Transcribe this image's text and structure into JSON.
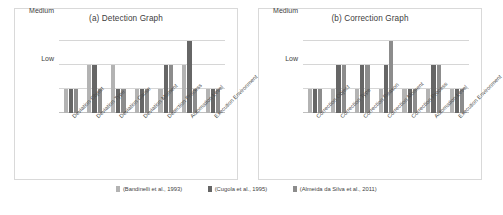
{
  "legend": {
    "position": "bottom-center",
    "entries": [
      {
        "label": "(Bandinelli et al., 1993)",
        "color": "#b3b3b3"
      },
      {
        "label": "(Cugola et al., 1995)",
        "color": "#666666"
      },
      {
        "label": "(Almeida da Silva et al., 2011)",
        "color": "#8c8c8c"
      }
    ]
  },
  "chart_data": [
    {
      "type": "bar",
      "id": "detection-graph",
      "title": "(a) Detection Graph",
      "xlabel": "",
      "ylabel": "",
      "grid": true,
      "ytick_labels": [
        "Low",
        "Medium",
        "High"
      ],
      "ytick_values": [
        1,
        2,
        3
      ],
      "ylim": [
        0,
        3.4
      ],
      "categories": [
        "Deviation Object",
        "Deviation Type",
        "Deviation Cause",
        "Deviation Moment",
        "Detection Process",
        "Automation Level",
        "Execution Environment"
      ],
      "series": [
        {
          "name": "(Bandinelli et al., 1993)",
          "color": "#b3b3b3",
          "values": [
            1,
            2,
            2,
            1,
            1,
            2,
            1
          ]
        },
        {
          "name": "(Cugola et al., 1995)",
          "color": "#666666",
          "values": [
            1,
            2,
            1,
            1,
            2,
            3,
            1
          ]
        },
        {
          "name": "(Almeida da Silva et al., 2011)",
          "color": "#8c8c8c",
          "values": [
            1,
            1,
            1,
            1,
            2,
            1,
            1
          ]
        }
      ]
    },
    {
      "type": "bar",
      "id": "correction-graph",
      "title": "(b) Correction Graph",
      "xlabel": "",
      "ylabel": "",
      "grid": true,
      "ytick_labels": [
        "Low",
        "Medium",
        "High"
      ],
      "ytick_values": [
        1,
        2,
        3
      ],
      "ylim": [
        0,
        3.4
      ],
      "categories": [
        "Correction Object",
        "Correction Type",
        "Correction Reason",
        "Correction Moment",
        "Correction Process",
        "Automation Level",
        "Execution Environment"
      ],
      "series": [
        {
          "name": "(Bandinelli et al., 1993)",
          "color": "#b3b3b3",
          "values": [
            1,
            1,
            1,
            1,
            1,
            1,
            1
          ]
        },
        {
          "name": "(Cugola et al., 1995)",
          "color": "#666666",
          "values": [
            1,
            2,
            2,
            2,
            1,
            2,
            1
          ]
        },
        {
          "name": "(Almeida da Silva et al., 2011)",
          "color": "#8c8c8c",
          "values": [
            1,
            2,
            2,
            3,
            1,
            2,
            1
          ]
        }
      ]
    }
  ]
}
